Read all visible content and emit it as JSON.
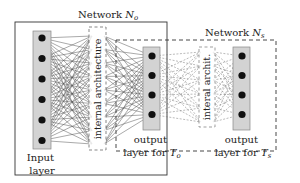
{
  "diagram": {
    "network_o": {
      "label": "Network ",
      "symbol": "N",
      "subscript": "o"
    },
    "network_s": {
      "label": "Network ",
      "symbol": "N",
      "subscript": "s"
    },
    "input_layer": {
      "line1": "Input",
      "line2": "layer",
      "nodes": 6
    },
    "internal_o": {
      "label": "internal architecture"
    },
    "internal_s": {
      "label": "interal archit."
    },
    "output_o": {
      "line1": "output",
      "line2": "layer for ",
      "symbol": "T",
      "subscript": "o",
      "nodes": 4
    },
    "output_s": {
      "line1": "output",
      "line2": "layer for ",
      "symbol": "T",
      "subscript": "s",
      "nodes": 4
    },
    "colors": {
      "layer_fill": "#d3d3d3",
      "layer_stroke": "#888888",
      "node": "#111111",
      "edge": "#555555",
      "box": "#333333"
    }
  }
}
